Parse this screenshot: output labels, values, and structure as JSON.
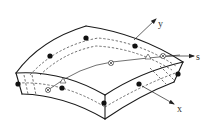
{
  "diagram": {
    "axes": [
      {
        "id": "y",
        "label": "y"
      },
      {
        "id": "s",
        "label": "s"
      },
      {
        "id": "x",
        "label": "x"
      }
    ],
    "legend_symbols": {
      "node": "filled-circle",
      "integration_point": "circled-cross",
      "reference_point": "open-triangle"
    },
    "colors": {
      "line": "#1a1a1a",
      "background": "#ffffff"
    }
  }
}
